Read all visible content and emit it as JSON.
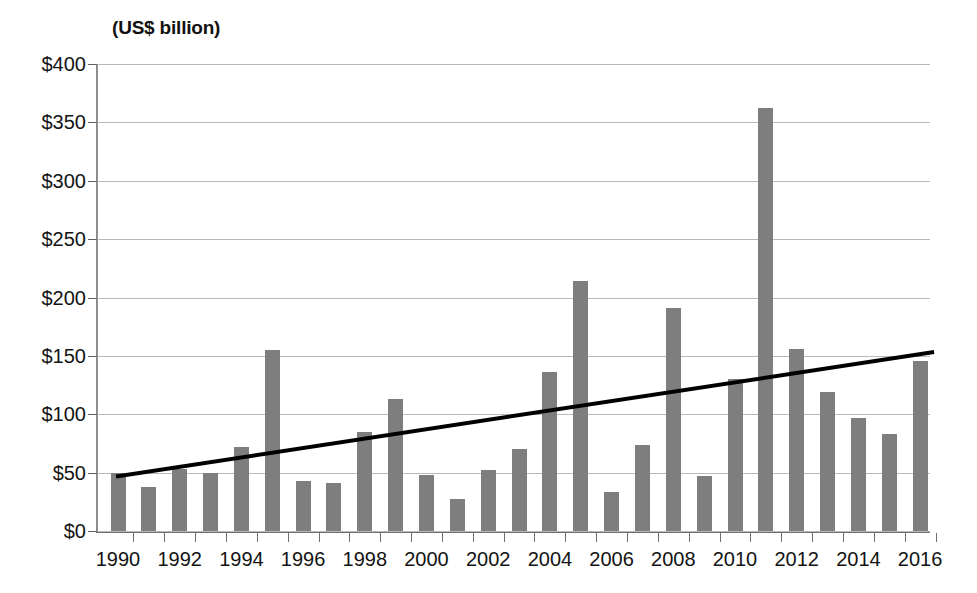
{
  "chart_data": {
    "type": "bar",
    "title": "(US$ billion)",
    "xlabel": "",
    "ylabel": "",
    "ylim": [
      0,
      400
    ],
    "ytick_step": 50,
    "grid": true,
    "legend": false,
    "bar_color": "#7e7e7e",
    "trendline_color": "#000000",
    "categories": [
      "1990",
      "1991",
      "1992",
      "1993",
      "1994",
      "1995",
      "1996",
      "1997",
      "1998",
      "1999",
      "2000",
      "2001",
      "2002",
      "2003",
      "2004",
      "2005",
      "2006",
      "2007",
      "2008",
      "2009",
      "2010",
      "2011",
      "2012",
      "2013",
      "2014",
      "2015",
      "2016"
    ],
    "values": [
      50,
      38,
      53,
      50,
      72,
      155,
      43,
      41,
      85,
      113,
      48,
      27,
      52,
      70,
      136,
      214,
      33,
      74,
      191,
      47,
      130,
      362,
      156,
      119,
      97,
      83,
      146
    ],
    "ytick_labels": [
      "$0",
      "$50",
      "$100",
      "$150",
      "$200",
      "$250",
      "$300",
      "$350",
      "$400"
    ],
    "ytick_values": [
      0,
      50,
      100,
      150,
      200,
      250,
      300,
      350,
      400
    ],
    "xtick_labels": [
      "1990",
      "1992",
      "1994",
      "1996",
      "1998",
      "2000",
      "2002",
      "2004",
      "2006",
      "2008",
      "2010",
      "2012",
      "2014",
      "2016"
    ],
    "xtick_label_years": [
      1990,
      1992,
      1994,
      1996,
      1998,
      2000,
      2002,
      2004,
      2006,
      2008,
      2010,
      2012,
      2014,
      2016
    ],
    "series": [
      {
        "name": "annual value",
        "type": "bar",
        "values": [
          50,
          38,
          53,
          50,
          72,
          155,
          43,
          41,
          85,
          113,
          48,
          27,
          52,
          70,
          136,
          214,
          33,
          74,
          191,
          47,
          130,
          362,
          156,
          119,
          97,
          83,
          146
        ]
      },
      {
        "name": "linear trend",
        "type": "line",
        "start_year": 1990,
        "end_year": 2016,
        "start_value": 47,
        "end_value": 153
      }
    ],
    "annotations": []
  }
}
